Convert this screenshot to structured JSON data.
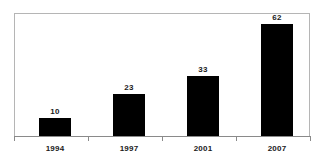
{
  "chart_data": {
    "type": "bar",
    "title": "",
    "subtitle": "",
    "xlabel": "",
    "ylabel": "",
    "categories": [
      "1994",
      "1997",
      "2001",
      "2007"
    ],
    "values": [
      10,
      23,
      33,
      62
    ],
    "series": [
      {
        "name": "",
        "values": [
          10,
          23,
          33,
          62
        ]
      }
    ],
    "data_labels": [
      "10",
      "23",
      "33",
      "62"
    ],
    "ylim": [
      0,
      68
    ],
    "grid": false,
    "legend": false,
    "legend_position": "none",
    "bar_color": "#000000",
    "frame_color": "#b5b5b5",
    "axis_color": "#8a8a8a",
    "label_color": "#1a1a1a",
    "background_color": "#ffffff"
  }
}
